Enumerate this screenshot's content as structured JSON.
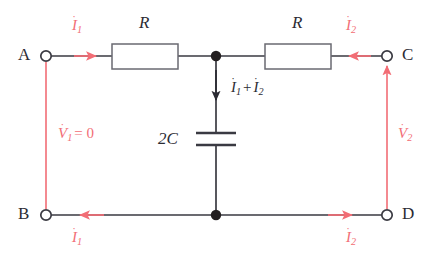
{
  "diagram": {
    "type": "circuit-schematic",
    "background_color": "#ffffff",
    "wire_color": "#3a3a42",
    "annotation_color": "#f26d75",
    "text_color": "#2b2b33",
    "width": 446,
    "height": 266
  },
  "terminals": [
    {
      "id": "A",
      "label": "A",
      "x": 46,
      "y": 56,
      "label_x": 22,
      "label_y": 47
    },
    {
      "id": "C",
      "label": "C",
      "x": 387,
      "y": 56,
      "label_x": 404,
      "label_y": 47
    },
    {
      "id": "B",
      "label": "B",
      "x": 46,
      "y": 215,
      "label_x": 22,
      "label_y": 206
    },
    {
      "id": "D",
      "label": "D",
      "x": 387,
      "y": 215,
      "label_x": 404,
      "label_y": 206
    }
  ],
  "junctions": [
    {
      "id": "top-center",
      "x": 216,
      "y": 56
    },
    {
      "id": "bottom-center",
      "x": 216,
      "y": 215
    }
  ],
  "components": [
    {
      "id": "resistor-left",
      "kind": "resistor",
      "label": "R",
      "label_x": 138,
      "label_y": 16,
      "box": {
        "x": 112,
        "y": 44,
        "w": 66,
        "h": 25
      }
    },
    {
      "id": "resistor-right",
      "kind": "resistor",
      "label": "R",
      "label_x": 290,
      "label_y": 16,
      "box": {
        "x": 265,
        "y": 44,
        "w": 66,
        "h": 25
      }
    },
    {
      "id": "capacitor-center",
      "kind": "capacitor",
      "label": "2C",
      "label_x": 162,
      "label_y": 135,
      "plate_top_y": 133,
      "plate_bottom_y": 145,
      "plate_half_width": 20,
      "x": 216
    }
  ],
  "annotations": [
    {
      "id": "current-i1-top",
      "kind": "current",
      "symbol": "I",
      "subscript": "1",
      "dot": true,
      "color": "#f26d75",
      "arrow_direction": "right",
      "label_x": 72,
      "label_y": 20
    },
    {
      "id": "current-i2-top",
      "kind": "current",
      "symbol": "I",
      "subscript": "2",
      "dot": true,
      "color": "#f26d75",
      "arrow_direction": "left",
      "label_x": 347,
      "label_y": 20
    },
    {
      "id": "current-i1-plus-i2-center",
      "kind": "current",
      "symbol": "I",
      "expression": "I1 + I2",
      "dot": true,
      "color": "#2b2b33",
      "arrow_direction": "down",
      "label_x": 232,
      "label_y": 82
    },
    {
      "id": "current-i1-bottom",
      "kind": "current",
      "symbol": "I",
      "subscript": "1",
      "dot": true,
      "color": "#f26d75",
      "arrow_direction": "left",
      "label_x": 72,
      "label_y": 232
    },
    {
      "id": "current-i2-bottom",
      "kind": "current",
      "symbol": "I",
      "subscript": "2",
      "dot": true,
      "color": "#f26d75",
      "arrow_direction": "right",
      "label_x": 347,
      "label_y": 232
    },
    {
      "id": "voltage-v1",
      "kind": "voltage",
      "symbol": "V",
      "subscript": "1",
      "dot": true,
      "equals": "= 0",
      "color": "#f26d75",
      "arrow_direction": "none",
      "label_x": 60,
      "label_y": 128
    },
    {
      "id": "voltage-v2",
      "kind": "voltage",
      "symbol": "V",
      "subscript": "2",
      "dot": true,
      "color": "#f26d75",
      "arrow_direction": "up",
      "label_x": 400,
      "label_y": 128
    }
  ],
  "text": {
    "terminal_a": "A",
    "terminal_b": "B",
    "terminal_c": "C",
    "terminal_d": "D",
    "resistor_left": "R",
    "resistor_right": "R",
    "capacitor": "2C",
    "i_symbol": "I",
    "v_symbol": "V",
    "dot": "˙",
    "sub_1": "1",
    "sub_2": "2",
    "plus": "+",
    "v1_equals_zero": "= 0"
  }
}
